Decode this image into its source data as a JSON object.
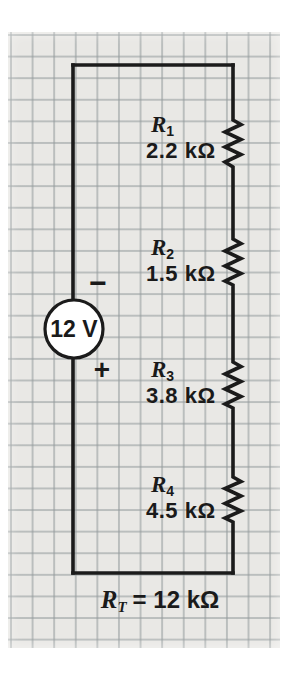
{
  "figure_type": "series-circuit-schematic",
  "circuit": {
    "source": {
      "label": "12 V",
      "polarity_top": "−",
      "polarity_bottom": "+"
    },
    "resistors": [
      {
        "symbol": "R",
        "sub": "1",
        "value": "2.2 kΩ"
      },
      {
        "symbol": "R",
        "sub": "2",
        "value": "1.5 kΩ"
      },
      {
        "symbol": "R",
        "sub": "3",
        "value": "3.8 kΩ"
      },
      {
        "symbol": "R",
        "sub": "4",
        "value": "4.5 kΩ"
      }
    ],
    "total_resistance": {
      "symbol": "R",
      "sub": "T",
      "rest": "= 12 kΩ"
    }
  },
  "colors": {
    "paper": "#e9e8e5",
    "grid_line": "#949b9d",
    "wire": "#1b1b1b",
    "text": "#1a1a1a",
    "source_fill": "#ffffff",
    "page_background": "#ffffff"
  }
}
